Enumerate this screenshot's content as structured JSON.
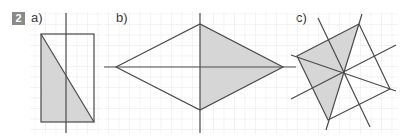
{
  "exercise": {
    "number": "2",
    "badge_color": "#8a8a8a"
  },
  "parts": [
    {
      "label": "a)",
      "shape": "rectangle divided by diagonal, half shaded, vertical symmetry axis"
    },
    {
      "label": "b)",
      "shape": "rhombus (kite) with horizontal and vertical axes, right half shaded"
    },
    {
      "label": "c)",
      "shape": "quadrilateral with four lines through center, left half shaded"
    }
  ],
  "colors": {
    "grid": "#e2e2e2",
    "line": "#4a4a4a",
    "shade": "#d6d6d6"
  }
}
